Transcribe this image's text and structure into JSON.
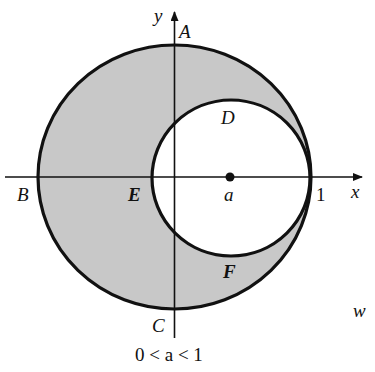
{
  "figure": {
    "type": "complex-plane region diagram",
    "colors": {
      "background": "#ffffff",
      "shaded_region": "#c8c8c8",
      "stroke": "#111111"
    },
    "axes": {
      "x_label": "x",
      "y_label": "y"
    },
    "points": {
      "A": "A",
      "B": "B",
      "C": "C",
      "D": "D",
      "E": "E",
      "F": "F"
    },
    "center_label": "a",
    "unit_label": "1",
    "plane_label": "w",
    "condition": "0 < a < 1",
    "outer_circle": "unit circle |w| = 1",
    "inner_circle": "circle centered at a, tangent at 1",
    "shaded": "region between outer and inner circles"
  }
}
